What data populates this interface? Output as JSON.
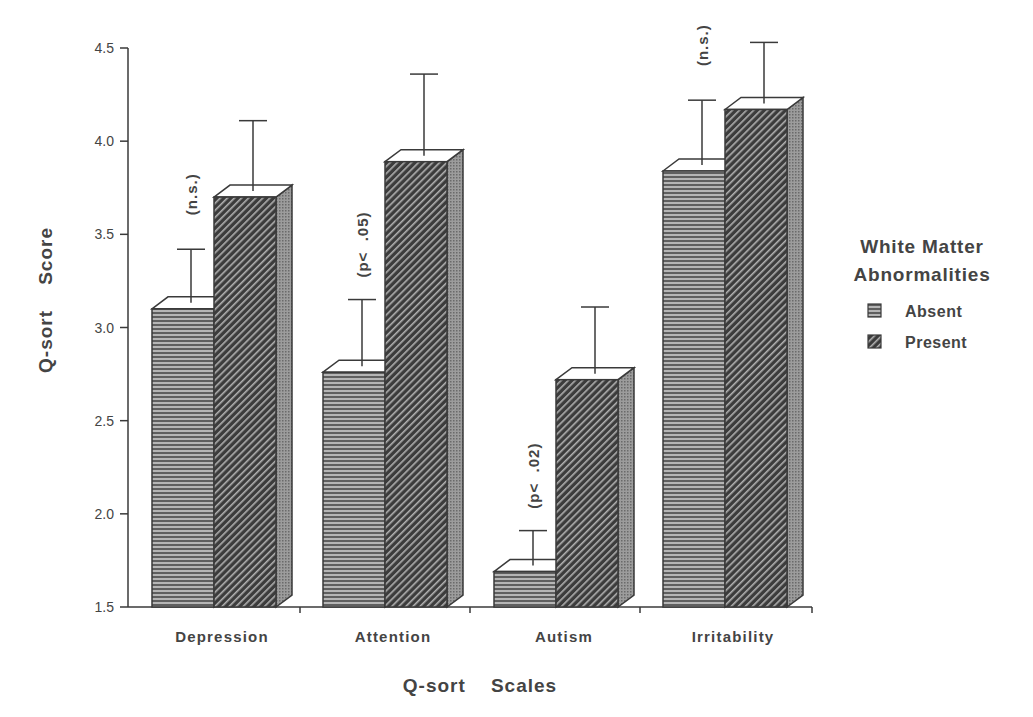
{
  "chart_data": {
    "type": "bar",
    "title": "",
    "xlabel": "Q-sort    Scales",
    "ylabel": "Q-sort    Score",
    "ylim": [
      1.5,
      4.5
    ],
    "yticks": [
      "1.5",
      "2.0",
      "2.5",
      "3.0",
      "3.5",
      "4.0",
      "4.5"
    ],
    "grid": false,
    "style": "3d-bars-with-error-bars",
    "categories": [
      "Depression",
      "Attention",
      "Autism",
      "Irritability"
    ],
    "series": [
      {
        "name": "Absent",
        "pattern": "horizontal-lines",
        "values": [
          3.1,
          2.76,
          1.69,
          3.84
        ],
        "error_upper": [
          3.42,
          3.15,
          1.91,
          4.22
        ]
      },
      {
        "name": "Present",
        "pattern": "diagonal-hatch",
        "values": [
          3.7,
          3.89,
          2.72,
          4.17
        ],
        "error_upper": [
          4.11,
          4.36,
          3.11,
          4.53
        ]
      }
    ],
    "annotations": [
      "(n.s.)",
      "(p<  .05)",
      "(p<  .02)",
      "(n.s.)"
    ],
    "legend": {
      "title_line1": "White Matter",
      "title_line2": "Abnormalities",
      "position": "right",
      "entries": [
        "Absent",
        "Present"
      ]
    }
  },
  "colors": {
    "ink": "#3a3a3a",
    "absent_fill": "#8a8a8a",
    "present_fill": "#4a4a4a",
    "side_fill": "#9a9a9a",
    "top_fill": "#ffffff"
  }
}
